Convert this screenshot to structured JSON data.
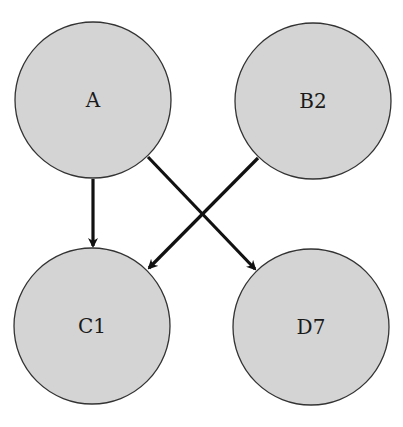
{
  "diagram": {
    "type": "directed-graph",
    "nodes": [
      {
        "id": "A",
        "label": "A",
        "cx": 93,
        "cy": 100,
        "r": 78
      },
      {
        "id": "B2",
        "label": "B2",
        "cx": 313,
        "cy": 101,
        "r": 78
      },
      {
        "id": "C1",
        "label": "C1",
        "cx": 92,
        "cy": 326,
        "r": 78
      },
      {
        "id": "D7",
        "label": "D7",
        "cx": 311,
        "cy": 327,
        "r": 78
      }
    ],
    "edges": [
      {
        "from": "A",
        "to": "C1",
        "x1": 93,
        "y1": 179,
        "x2": 93,
        "y2": 246
      },
      {
        "from": "A",
        "to": "D7",
        "x1": 148,
        "y1": 157,
        "x2": 255,
        "y2": 269
      },
      {
        "from": "B2",
        "to": "C1",
        "x1": 258,
        "y1": 158,
        "x2": 149,
        "y2": 268
      }
    ],
    "colors": {
      "node_fill": "#d4d4d4",
      "node_stroke": "#333333",
      "edge": "#111111"
    }
  }
}
